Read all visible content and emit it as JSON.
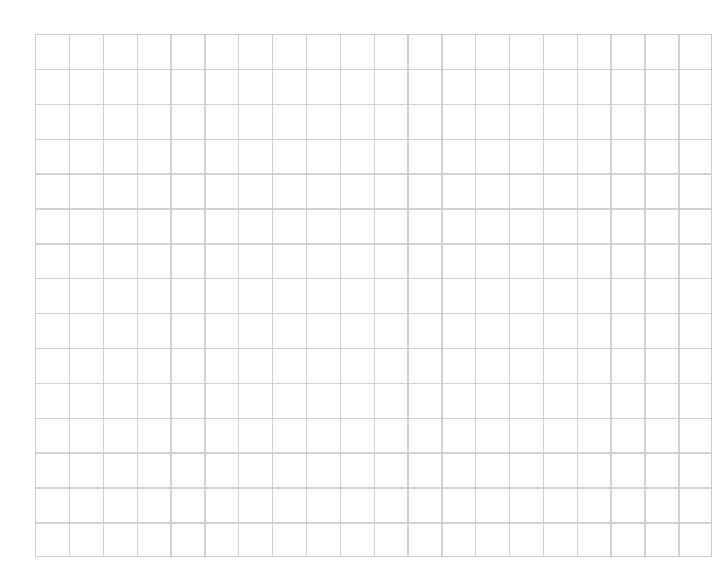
{
  "page": {
    "background_color": "#ffffff",
    "width": 727,
    "height": 582
  },
  "grid": {
    "name": "graph-paper-grid",
    "description": "Blank square grid / graph paper sheet",
    "origin_x": 35,
    "origin_y": 34,
    "width": 677,
    "height": 523,
    "columns": 20,
    "rows": 15,
    "cell_width": 33.85,
    "cell_height": 34.87,
    "line_color": "#c9c9c9",
    "line_width": 1.4,
    "background_color": "#ffffff",
    "has_labels": false,
    "has_text": false
  },
  "chart_data": {
    "type": "table",
    "title": "",
    "subtitle": "",
    "xlabel": "",
    "ylabel": "",
    "grid": true,
    "legend": null,
    "columns": 20,
    "rows": 15,
    "categories": [],
    "values": [],
    "annotations": [],
    "note": "Empty square-ruled grid; no plotted data, labels, ticks or legend are present in the image."
  }
}
